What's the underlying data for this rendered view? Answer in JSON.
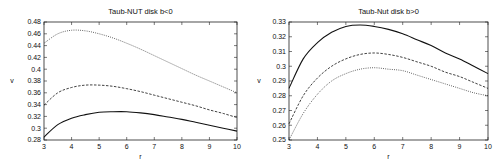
{
  "chart_data": [
    {
      "type": "line",
      "title": "Taub-NUT  disk b<0",
      "xlabel": "r",
      "ylabel": "v",
      "xlim": [
        3,
        10
      ],
      "ylim": [
        0.28,
        0.48
      ],
      "xticks": [
        3,
        4,
        5,
        6,
        7,
        8,
        9,
        10
      ],
      "yticks": [
        0.28,
        0.3,
        0.32,
        0.34,
        0.36,
        0.38,
        0.4,
        0.42,
        0.44,
        0.46,
        0.48
      ],
      "ytick_labels": [
        "0.28",
        "0.3",
        "0.32",
        "0.34",
        "0.36",
        "0.38",
        "0.4",
        "0.42",
        "0.44",
        "0.46",
        "0.48"
      ],
      "grid": false,
      "legend": null,
      "x": [
        3,
        3.5,
        4,
        4.5,
        5,
        5.5,
        6,
        6.5,
        7,
        7.5,
        8,
        8.5,
        9,
        9.5,
        10
      ],
      "series": [
        {
          "name": "dotted",
          "style": "dotted",
          "values": [
            0.444,
            0.46,
            0.466,
            0.465,
            0.46,
            0.453,
            0.444,
            0.434,
            0.423,
            0.412,
            0.401,
            0.39,
            0.38,
            0.37,
            0.36
          ]
        },
        {
          "name": "dashed",
          "style": "dashed",
          "values": [
            0.339,
            0.36,
            0.369,
            0.373,
            0.373,
            0.371,
            0.367,
            0.362,
            0.356,
            0.35,
            0.344,
            0.338,
            0.331,
            0.325,
            0.318
          ]
        },
        {
          "name": "solid",
          "style": "solid",
          "values": [
            0.285,
            0.306,
            0.317,
            0.323,
            0.327,
            0.328,
            0.328,
            0.326,
            0.323,
            0.319,
            0.315,
            0.31,
            0.305,
            0.3,
            0.295
          ]
        }
      ]
    },
    {
      "type": "line",
      "title": "Taub-Nut disk b>0",
      "xlabel": "r",
      "ylabel": "v",
      "xlim": [
        3,
        10
      ],
      "ylim": [
        0.25,
        0.33
      ],
      "xticks": [
        3,
        4,
        5,
        6,
        7,
        8,
        9,
        10
      ],
      "yticks": [
        0.25,
        0.26,
        0.27,
        0.28,
        0.29,
        0.3,
        0.31,
        0.32,
        0.33
      ],
      "ytick_labels": [
        "0.25",
        "0.26",
        "0.27",
        "0.28",
        "0.29",
        "0.3",
        "0.31",
        "0.32",
        "0.33"
      ],
      "grid": false,
      "legend": null,
      "x": [
        3,
        3.5,
        4,
        4.5,
        5,
        5.5,
        6,
        6.5,
        7,
        7.5,
        8,
        8.5,
        9,
        9.5,
        10
      ],
      "series": [
        {
          "name": "solid",
          "style": "solid",
          "values": [
            0.285,
            0.305,
            0.316,
            0.323,
            0.327,
            0.328,
            0.327,
            0.325,
            0.322,
            0.318,
            0.314,
            0.309,
            0.305,
            0.3,
            0.295
          ]
        },
        {
          "name": "dashed",
          "style": "dashed",
          "values": [
            0.261,
            0.28,
            0.292,
            0.3,
            0.305,
            0.308,
            0.309,
            0.308,
            0.306,
            0.303,
            0.3,
            0.296,
            0.293,
            0.289,
            0.285
          ]
        },
        {
          "name": "dotted",
          "style": "dotted",
          "values": [
            0.25,
            0.268,
            0.281,
            0.29,
            0.295,
            0.298,
            0.299,
            0.298,
            0.297,
            0.294,
            0.291,
            0.288,
            0.285,
            0.282,
            0.28
          ]
        }
      ]
    }
  ],
  "charts": [
    {
      "title": "Taub-NUT  disk b<0",
      "xlabel": "r",
      "ylabel": "v"
    },
    {
      "title": "Taub-Nut disk b>0",
      "xlabel": "r",
      "ylabel": "v"
    }
  ],
  "style": {
    "line_color": "#111111",
    "axis_color": "#222222",
    "background": "#ffffff"
  }
}
